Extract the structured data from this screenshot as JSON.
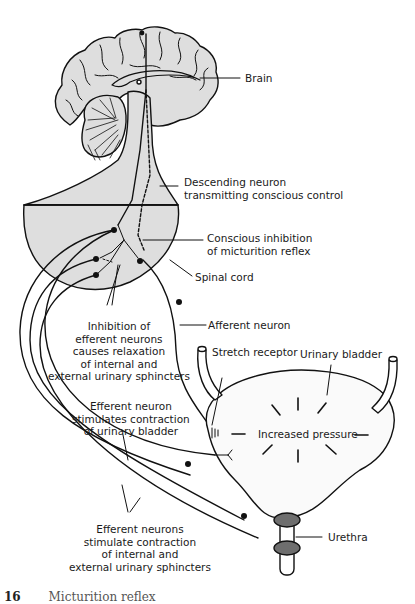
{
  "figure": {
    "type": "anatomical-diagram",
    "subject": "Micturition reflex",
    "colors": {
      "fill": "#dedede",
      "line": "#111111",
      "sphincter": "#6e6e6e",
      "background": "#ffffff"
    }
  },
  "labels": {
    "brain": "Brain",
    "descending_neuron": [
      "Descending neuron",
      "transmitting conscious control"
    ],
    "conscious_inhibition": [
      "Conscious inhibition",
      "of micturition reflex"
    ],
    "spinal_cord": "Spinal cord",
    "afferent_neuron": "Afferent neuron",
    "inhibition_efferent": [
      "Inhibition of",
      "efferent neurons",
      "causes relaxation",
      "of internal and",
      "external urinary sphincters"
    ],
    "stretch_receptor": "Stretch receptor",
    "urinary_bladder": "Urinary bladder",
    "increased_pressure": "Increased pressure",
    "efferent_bladder": [
      "Efferent neuron",
      "stimulates contraction",
      "of urinary bladder"
    ],
    "efferent_sphincters": [
      "Efferent neurons",
      "stimulate contraction",
      "of internal and",
      "external urinary sphincters"
    ],
    "urethra": "Urethra"
  },
  "caption": {
    "number": "16",
    "text": "Micturition reflex (cut off)"
  }
}
